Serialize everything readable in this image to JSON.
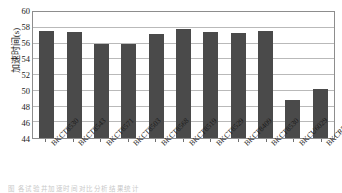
{
  "chart_data": {
    "type": "bar",
    "title": "",
    "xlabel": "",
    "ylabel": "加速时间(s)",
    "ylim": [
      44,
      60
    ],
    "ytick_step": 2,
    "yticks": [
      44,
      46,
      48,
      50,
      52,
      54,
      56,
      58,
      60
    ],
    "grid": true,
    "legend": "none",
    "bar_color": "#4a4a4a",
    "categories": [
      "BKCT8530",
      "BKCT8543",
      "BKCT8571",
      "BKCT8503",
      "BKCT8568",
      "BKCT8519",
      "BKCT8529",
      "BKCT8409",
      "BKCT8530",
      "BKCU6029",
      "BKCR5070"
    ],
    "values": [
      57.6,
      57.4,
      56.0,
      56.0,
      57.2,
      57.9,
      57.5,
      57.3,
      57.6,
      48.8,
      50.2
    ]
  },
  "caption": {
    "text": "图 各试验井加速时间对比分析结果统计"
  },
  "colors": {
    "bar": "#4a4a4a",
    "frame": "#8d8d8d",
    "grid": "#b9b9b9",
    "text": "#1a1a1a",
    "plot_background": "#ffffff"
  }
}
